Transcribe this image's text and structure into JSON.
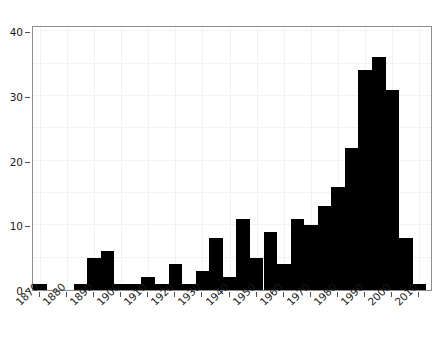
{
  "chart_data": {
    "type": "bar",
    "title": "",
    "subtitle": "",
    "xlabel": "",
    "ylabel": "",
    "xlim": [
      1867.5,
      2015
    ],
    "ylim": [
      0,
      41
    ],
    "grid": true,
    "legend": null,
    "bin_width": 5,
    "bar_color": "#000000",
    "x": [
      1870,
      1875,
      1880,
      1885,
      1890,
      1895,
      1900,
      1905,
      1910,
      1915,
      1920,
      1925,
      1930,
      1935,
      1940,
      1945,
      1950,
      1955,
      1960,
      1965,
      1970,
      1975,
      1980,
      1985,
      1990,
      1995,
      2000,
      2005,
      2010
    ],
    "categories": [
      "1870",
      "1875",
      "1880",
      "1885",
      "1890",
      "1895",
      "1900",
      "1905",
      "1910",
      "1915",
      "1920",
      "1925",
      "1930",
      "1935",
      "1940",
      "1945",
      "1950",
      "1955",
      "1960",
      "1965",
      "1970",
      "1975",
      "1980",
      "1985",
      "1990",
      "1995",
      "2000",
      "2005",
      "2010"
    ],
    "values": [
      1,
      0,
      0,
      1,
      5,
      6,
      1,
      1,
      2,
      1,
      4,
      1,
      3,
      8,
      2,
      11,
      5,
      9,
      4,
      11,
      10,
      13,
      16,
      22,
      34,
      36,
      31,
      8,
      1
    ],
    "yticks": [
      0,
      10,
      20,
      30,
      40
    ],
    "ytick_labels": [
      "0",
      "10",
      "20",
      "30",
      "40"
    ],
    "xticks": [
      1870,
      1880,
      1890,
      1900,
      1910,
      1920,
      1930,
      1940,
      1950,
      1960,
      1970,
      1980,
      1990,
      2000,
      2010
    ],
    "xtick_labels": [
      "1870",
      "1880",
      "1890",
      "1900",
      "1910",
      "1920",
      "1930",
      "1940",
      "1950",
      "1960",
      "1970",
      "1980",
      "1990",
      "2000",
      "2010"
    ],
    "minor_gridlines_y": [
      5,
      15,
      25,
      35
    ],
    "axis_color": "#8d8d8d",
    "grid_color": "#f2f2f2"
  }
}
